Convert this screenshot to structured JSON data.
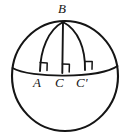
{
  "figure": {
    "kind": "geometry-diagram",
    "stroke_color": "#151515",
    "background_color": "#ffffff",
    "labels": {
      "apex": "B",
      "foot_left": "A",
      "foot_middle": "C",
      "foot_right": "C'"
    },
    "points": {
      "B": {
        "x": 63,
        "y": 21
      },
      "A": {
        "x": 40,
        "y": 71
      },
      "C": {
        "x": 62,
        "y": 73
      },
      "C_prime": {
        "x": 85,
        "y": 70
      }
    },
    "sphere": {
      "center_x": 65,
      "center_y": 76,
      "radius_x": 53,
      "radius_y": 55
    },
    "right_angle_marks": [
      {
        "at": "A",
        "x": 40,
        "y": 71
      },
      {
        "at": "C",
        "x": 62,
        "y": 73
      },
      {
        "at": "C'",
        "x": 85,
        "y": 70
      }
    ]
  }
}
